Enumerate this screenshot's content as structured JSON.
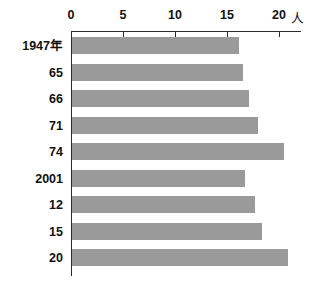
{
  "chart_data": {
    "type": "bar",
    "orientation": "horizontal",
    "title": "",
    "subtitle": "",
    "xlabel": "",
    "ylabel": "",
    "unit": "人",
    "categories": [
      "1947年",
      "65",
      "66",
      "71",
      "74",
      "2001",
      "12",
      "15",
      "20"
    ],
    "values": [
      16.2,
      16.5,
      17.1,
      18.0,
      20.5,
      16.7,
      17.7,
      18.4,
      20.9
    ],
    "series": [
      {
        "name": "",
        "values": [
          16.2,
          16.5,
          17.1,
          18.0,
          20.5,
          16.7,
          17.7,
          18.4,
          20.9
        ]
      }
    ],
    "xlim": [
      0,
      22
    ],
    "xticks": [
      0,
      5,
      10,
      15,
      20
    ],
    "xtick_labels": [
      "0",
      "5",
      "10",
      "15",
      "20"
    ],
    "grid": false,
    "legend": false,
    "legend_position": "none",
    "bar_color": "#9a9a9a",
    "axis_color": "#2b2b2b",
    "text_color": "#111111",
    "background_color": "#ffffff"
  },
  "axis": {
    "unit_label": "人",
    "ticks": [
      {
        "label": "0",
        "value": 0
      },
      {
        "label": "5",
        "value": 5
      },
      {
        "label": "10",
        "value": 10
      },
      {
        "label": "15",
        "value": 15
      },
      {
        "label": "20",
        "value": 20
      }
    ]
  },
  "bars": [
    {
      "label": "1947年",
      "value": 16.2
    },
    {
      "label": "65",
      "value": 16.5
    },
    {
      "label": "66",
      "value": 17.1
    },
    {
      "label": "71",
      "value": 18.0
    },
    {
      "label": "74",
      "value": 20.5
    },
    {
      "label": "2001",
      "value": 16.7
    },
    {
      "label": "12",
      "value": 17.7
    },
    {
      "label": "15",
      "value": 18.4
    },
    {
      "label": "20",
      "value": 20.9
    }
  ]
}
